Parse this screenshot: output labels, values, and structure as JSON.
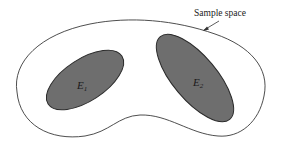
{
  "diagram": {
    "type": "venn-diagram",
    "sample_space": {
      "label": "Sample space",
      "outline_color": "#3a3a3a",
      "fill_color": "#ffffff"
    },
    "events": [
      {
        "id": "E1",
        "label_main": "E",
        "label_sub": "1",
        "fill_color": "#6e6e6e",
        "outline_color": "#2a2a2a"
      },
      {
        "id": "E2",
        "label_main": "E",
        "label_sub": "2",
        "fill_color": "#6e6e6e",
        "outline_color": "#2a2a2a"
      }
    ],
    "colors": {
      "background": "#ffffff",
      "event_fill": "#6e6e6e",
      "line": "#333333"
    }
  }
}
